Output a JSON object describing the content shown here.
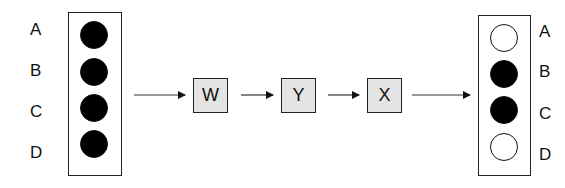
{
  "input": {
    "labels": [
      "A",
      "B",
      "C",
      "D"
    ],
    "states": [
      "on",
      "on",
      "on",
      "on"
    ]
  },
  "gates": [
    {
      "label": "W"
    },
    {
      "label": "Y"
    },
    {
      "label": "X"
    }
  ],
  "output": {
    "labels": [
      "A",
      "B",
      "C",
      "D"
    ],
    "states": [
      "off",
      "on",
      "on",
      "off"
    ]
  },
  "colors": {
    "gate_fill": "#e4e4e4",
    "bit_on": "#000000",
    "bit_off": "#ffffff",
    "stroke": "#222222"
  }
}
